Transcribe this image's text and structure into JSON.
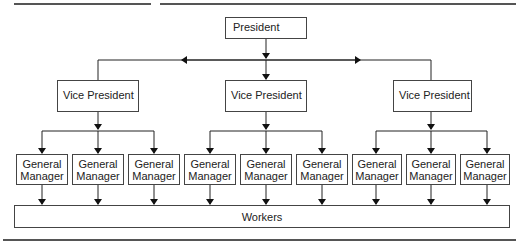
{
  "diagram": {
    "top": {
      "label": "President"
    },
    "level2": [
      {
        "label": "Vice President"
      },
      {
        "label": "Vice President"
      },
      {
        "label": "Vice President"
      }
    ],
    "level3": [
      {
        "line1": "General",
        "line2": "Manager"
      },
      {
        "line1": "General",
        "line2": "Manager"
      },
      {
        "line1": "General",
        "line2": "Manager"
      },
      {
        "line1": "General",
        "line2": "Manager"
      },
      {
        "line1": "General",
        "line2": "Manager"
      },
      {
        "line1": "General",
        "line2": "Manager"
      },
      {
        "line1": "General",
        "line2": "Manager"
      },
      {
        "line1": "General",
        "line2": "Manager"
      },
      {
        "line1": "General",
        "line2": "Manager"
      }
    ],
    "bottom": {
      "label": "Workers"
    }
  }
}
